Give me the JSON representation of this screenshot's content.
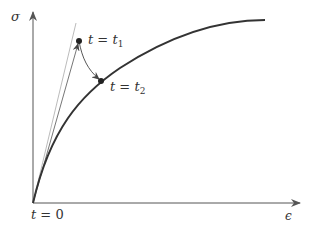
{
  "diagram": {
    "type": "stress-strain relaxation sketch",
    "axes": {
      "y_label": "σ",
      "x_label": "ϵ"
    },
    "points": [
      {
        "id": "t1",
        "label_var": "t",
        "label_eq": " = ",
        "label_val": "t",
        "label_sub": "1"
      },
      {
        "id": "t2",
        "label_var": "t",
        "label_eq": " = ",
        "label_val": "t",
        "label_sub": "2"
      }
    ],
    "origin_label": {
      "var": "t",
      "eq": " = ",
      "val": "0"
    },
    "colors": {
      "axis": "#555555",
      "curve": "#333333",
      "tangent": "#aaaaaa",
      "loading_line": "#666666",
      "point": "#222222"
    }
  }
}
